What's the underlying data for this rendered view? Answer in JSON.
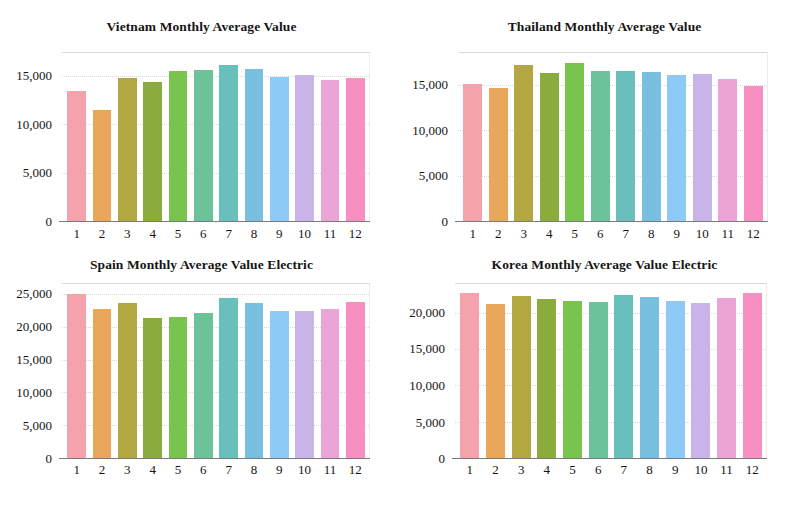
{
  "figure": {
    "panels": [
      "vietnam",
      "thailand",
      "spain",
      "korea"
    ]
  },
  "palette": {
    "colors": [
      "#f4a3ad",
      "#e8a köp",
      "#b5a642",
      "#8fae3e",
      "#77c košt",
      "#6ec5a0",
      "#6cc0bd",
      "#7ac0e0",
      "#8fc9f5",
      "#c9b4ea",
      "#eda9d8",
      "#f78fc0"
    ]
  },
  "bar_colors": [
    "#f4a3ad",
    "#e8a75a",
    "#b3a742",
    "#8cab3d",
    "#78c council",
    "#6cc39a",
    "#68bfbc",
    "#79c0e0",
    "#8ecaf6",
    "#c9b4ea",
    "#eaa5d6",
    "#f78fc0"
  ],
  "chart_data": [
    {
      "type": "bar",
      "id": "vietnam",
      "title": "Vietnam Monthly Average Value",
      "xlabel": "",
      "ylabel": "",
      "categories": [
        "1",
        "2",
        "3",
        "4",
        "5",
        "6",
        "7",
        "8",
        "9",
        "10",
        "11",
        "12"
      ],
      "values": [
        13500,
        11500,
        14800,
        14400,
        15500,
        15600,
        16200,
        15800,
        14900,
        15100,
        14600,
        14800
      ],
      "ylim": [
        0,
        17500
      ],
      "yticks": [
        0,
        5000,
        10000,
        15000
      ],
      "ytick_labels": [
        "0",
        "5,000",
        "10,000",
        "15,000"
      ],
      "grid": true,
      "legend": "none",
      "colors": [
        "#f4a3ad",
        "#e8a75a",
        "#b3a742",
        "#8cab3d",
        "#78c44e",
        "#6cc39a",
        "#68bfbc",
        "#79c0e0",
        "#8ecaf6",
        "#c9b4ea",
        "#eaa5d6",
        "#f78fc0"
      ]
    },
    {
      "type": "bar",
      "id": "thailand",
      "title": "Thailand Monthly Average Value",
      "xlabel": "",
      "ylabel": "",
      "categories": [
        "1",
        "2",
        "3",
        "4",
        "5",
        "6",
        "7",
        "8",
        "9",
        "10",
        "11",
        "12"
      ],
      "values": [
        15100,
        14700,
        17200,
        16300,
        17400,
        16500,
        16500,
        16400,
        16100,
        16200,
        15700,
        14900
      ],
      "ylim": [
        0,
        18600
      ],
      "yticks": [
        0,
        5000,
        10000,
        15000
      ],
      "ytick_labels": [
        "0",
        "5,000",
        "10,000",
        "15,000"
      ],
      "grid": true,
      "legend": "none",
      "colors": [
        "#f4a3ad",
        "#e8a75a",
        "#b3a742",
        "#8cab3d",
        "#78c44e",
        "#6cc39a",
        "#68bfbc",
        "#79c0e0",
        "#8ecaf6",
        "#c9b4ea",
        "#eaa5d6",
        "#f78fc0"
      ]
    },
    {
      "type": "bar",
      "id": "spain",
      "title": "Spain Monthly Average Value Electric",
      "xlabel": "",
      "ylabel": "",
      "categories": [
        "1",
        "2",
        "3",
        "4",
        "5",
        "6",
        "7",
        "8",
        "9",
        "10",
        "11",
        "12"
      ],
      "values": [
        25000,
        22800,
        23700,
        21400,
        21500,
        22100,
        24500,
        23600,
        22500,
        22400,
        22700,
        23800
      ],
      "ylim": [
        0,
        26700
      ],
      "yticks": [
        0,
        5000,
        10000,
        15000,
        20000,
        25000
      ],
      "ytick_labels": [
        "0",
        "5,000",
        "10,000",
        "15,000",
        "20,000",
        "25,000"
      ],
      "grid": true,
      "legend": "none",
      "colors": [
        "#f4a3ad",
        "#e8a75a",
        "#b3a742",
        "#8cab3d",
        "#78c44e",
        "#6cc39a",
        "#68bfbc",
        "#79c0e0",
        "#8ecaf6",
        "#c9b4ea",
        "#eaa5d6",
        "#f78fc0"
      ]
    },
    {
      "type": "bar",
      "id": "korea",
      "title": "Korea Monthly Average Value Electric",
      "xlabel": "",
      "ylabel": "",
      "categories": [
        "1",
        "2",
        "3",
        "4",
        "5",
        "6",
        "7",
        "8",
        "9",
        "10",
        "11",
        "12"
      ],
      "values": [
        22800,
        21200,
        22300,
        21900,
        21600,
        21500,
        22400,
        22200,
        21600,
        21400,
        22000,
        22700
      ],
      "ylim": [
        0,
        24100
      ],
      "yticks": [
        0,
        5000,
        10000,
        15000,
        20000
      ],
      "ytick_labels": [
        "0",
        "5,000",
        "10,000",
        "15,000",
        "20,000"
      ],
      "grid": true,
      "legend": "none",
      "colors": [
        "#f4a3ad",
        "#e8a75a",
        "#b3a742",
        "#8cab3d",
        "#78c44e",
        "#6cc39a",
        "#68bfbc",
        "#79c0e0",
        "#8ecaf6",
        "#c9b4ea",
        "#eaa5d6",
        "#f78fc0"
      ]
    }
  ]
}
